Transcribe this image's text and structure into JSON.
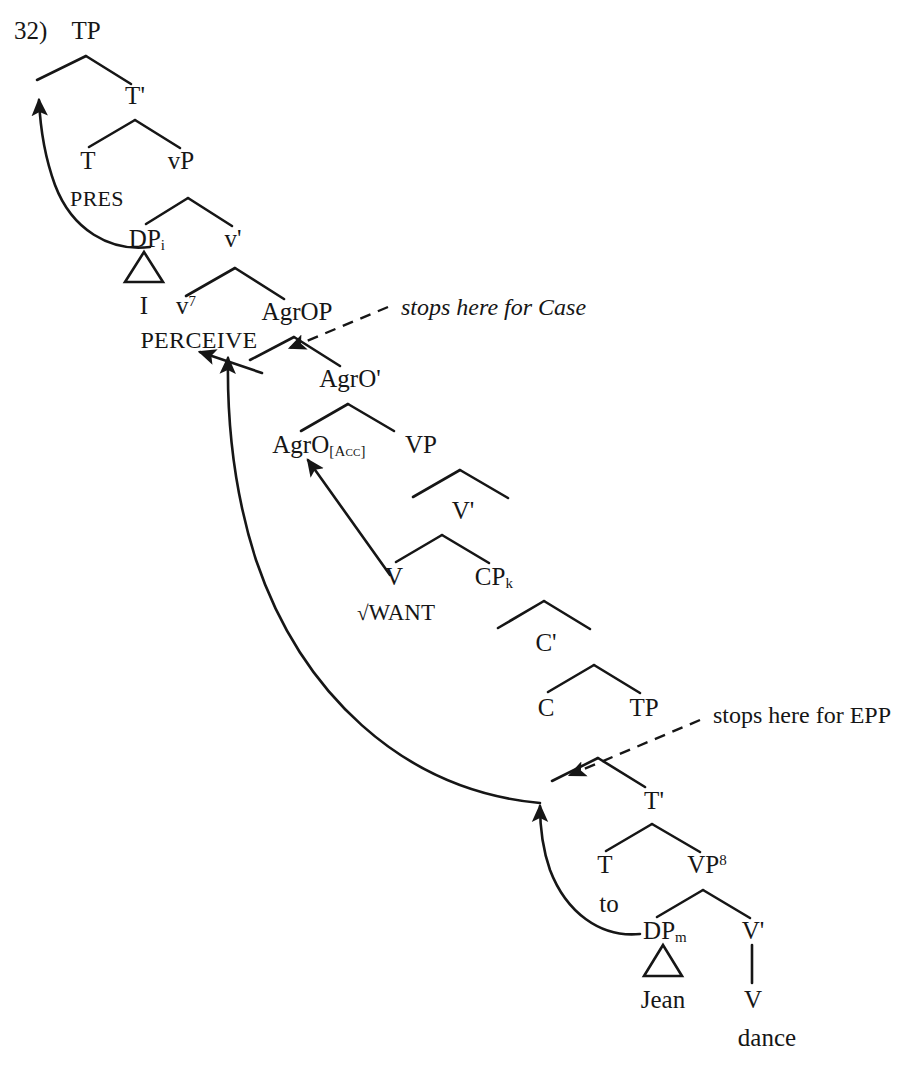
{
  "figure": {
    "number_label": "32)",
    "domain": "syntax-tree-diagram",
    "ink_color": "#161616",
    "background_color": "#ffffff"
  },
  "nodes": {
    "tp_top": "TP",
    "t_bar_top": "T'",
    "t_top": "T",
    "pres": "PRES",
    "vp_small": "vP",
    "dp_i": "DP",
    "dp_i_sub": "i",
    "v_bar_small": "v'",
    "i_terminal": "I",
    "v_small_head": "v",
    "v_small_sup": "7",
    "perceive": "PERCEIVE",
    "agrop": "AgrOP",
    "agro_bar": "AgrO'",
    "agro_head": "AgrO",
    "agro_head_sub": "[Acc]",
    "vp_big": "VP",
    "v_bar_big": "V'",
    "v_big": "V",
    "want": "WANT",
    "want_radical": "√",
    "cp_k": "CP",
    "cp_k_sub": "k",
    "c_bar": "C'",
    "c_head": "C",
    "tp_lower": "TP",
    "t_bar_lower": "T'",
    "t_lower": "T",
    "to": "to",
    "vp_sup_node": "VP",
    "vp_sup_sup": "8",
    "dp_m": "DP",
    "dp_m_sub": "m",
    "jean": "Jean",
    "v_bar_lower": "V'",
    "v_lower": "V",
    "dance": "dance"
  },
  "annotations": [
    {
      "id": "case-note",
      "text": "stops here for Case",
      "style": "italic"
    },
    {
      "id": "epp-note",
      "text": "stops here for EPP",
      "style": "roman"
    }
  ],
  "movement_arrows": [
    {
      "id": "dp-to-spec-tp",
      "from": "DP_i",
      "to": "Spec,TP",
      "kind": "solid-curved"
    },
    {
      "id": "dp-to-spec-agrop",
      "from": "Spec,AgrOP",
      "to": "PERCEIVE",
      "kind": "solid-straight"
    },
    {
      "id": "dpm-long-raise",
      "from": "Spec,TP (lower)",
      "to": "PERCEIVE",
      "kind": "solid-curved"
    },
    {
      "id": "dpm-to-spec-tp-lower",
      "from": "DP_m",
      "to": "Spec,TP (lower)",
      "kind": "solid-curved"
    },
    {
      "id": "v-to-agro",
      "from": "V",
      "to": "AgrO",
      "kind": "solid-straight"
    },
    {
      "id": "case-dashed",
      "from": "stops here for Case",
      "to": "Spec,AgrOP",
      "kind": "dashed"
    },
    {
      "id": "epp-dashed",
      "from": "stops here for EPP",
      "to": "Spec,TP (lower)",
      "kind": "dashed"
    }
  ]
}
